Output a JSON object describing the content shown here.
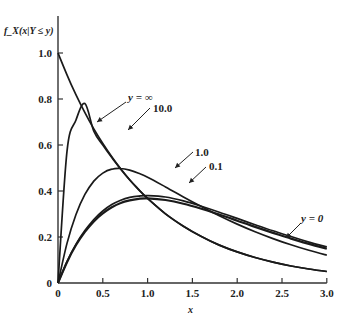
{
  "chart_data": {
    "type": "line",
    "title": "",
    "xlabel": "x",
    "ylabel": "f_X(x|Y ≤ y)",
    "xlim": [
      0,
      3.0
    ],
    "ylim": [
      0,
      1.1
    ],
    "grid": false,
    "legend_position": "inline-annotations",
    "x_ticks": [
      "0",
      "0.5",
      "1.0",
      "1.5",
      "2.0",
      "2.5",
      "3.0"
    ],
    "y_ticks": [
      "0",
      "0.2",
      "0.4",
      "0.6",
      "0.8",
      "1.0"
    ],
    "x": [
      0,
      0.1,
      0.2,
      0.3,
      0.4,
      0.5,
      0.6,
      0.7,
      0.8,
      0.9,
      1.0,
      1.2,
      1.4,
      1.6,
      1.8,
      2.0,
      2.2,
      2.4,
      2.6,
      2.8,
      3.0
    ],
    "series": [
      {
        "name": "y = ∞",
        "label": "y = ∞",
        "values": [
          1.0,
          0.905,
          0.819,
          0.741,
          0.67,
          0.607,
          0.549,
          0.497,
          0.449,
          0.407,
          0.368,
          0.301,
          0.247,
          0.202,
          0.165,
          0.135,
          0.111,
          0.091,
          0.074,
          0.061,
          0.05
        ]
      },
      {
        "name": "10.0",
        "label": "10.0",
        "values": [
          0.0,
          0.572,
          0.708,
          0.78,
          0.66,
          0.6,
          0.545,
          0.495,
          0.448,
          0.406,
          0.368,
          0.301,
          0.247,
          0.202,
          0.165,
          0.135,
          0.111,
          0.091,
          0.074,
          0.061,
          0.05
        ]
      },
      {
        "name": "1.0",
        "label": "1.0",
        "values": [
          0.0,
          0.172,
          0.297,
          0.385,
          0.443,
          0.478,
          0.495,
          0.498,
          0.491,
          0.477,
          0.46,
          0.418,
          0.374,
          0.332,
          0.292,
          0.256,
          0.223,
          0.193,
          0.166,
          0.142,
          0.121
        ]
      },
      {
        "name": "0.1",
        "label": "0.1",
        "values": [
          0.0,
          0.093,
          0.168,
          0.228,
          0.276,
          0.313,
          0.341,
          0.36,
          0.372,
          0.378,
          0.38,
          0.374,
          0.357,
          0.334,
          0.308,
          0.281,
          0.253,
          0.227,
          0.202,
          0.178,
          0.157
        ]
      },
      {
        "name": "y = 0",
        "label": "y = 0",
        "values": [
          0.0,
          0.09,
          0.164,
          0.222,
          0.268,
          0.303,
          0.329,
          0.348,
          0.359,
          0.366,
          0.368,
          0.361,
          0.345,
          0.323,
          0.298,
          0.271,
          0.244,
          0.218,
          0.193,
          0.17,
          0.149
        ]
      }
    ],
    "annotations": [
      {
        "text": "y = ∞",
        "x": 0.55,
        "y": 0.88
      },
      {
        "text": "10.0",
        "x": 1.05,
        "y": 0.77
      },
      {
        "text": "1.0",
        "x": 1.3,
        "y": 0.5
      },
      {
        "text": "0.1",
        "x": 1.7,
        "y": 0.44
      },
      {
        "text": "y = 0",
        "x": 2.75,
        "y": 0.23
      }
    ]
  }
}
